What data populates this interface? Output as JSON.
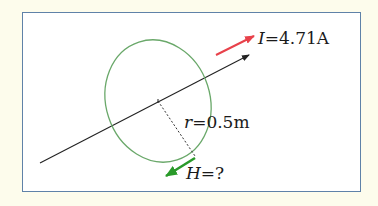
{
  "diagram": {
    "type": "magnetic-field-around-current-carrying-wire",
    "current": {
      "symbol": "I",
      "equals": "=",
      "value": "4.71A",
      "arrow_color": "#e8414a"
    },
    "radius": {
      "symbol": "r",
      "equals": "=",
      "value": "0.5m"
    },
    "field": {
      "symbol": "H",
      "equals": "=",
      "value": "?",
      "arrow_color": "#2a9a2a"
    },
    "colors": {
      "background": "#fdfcec",
      "frame_border": "#5f82a8",
      "wire": "#222222",
      "loop": "#6aa86a",
      "current_arrow": "#e8414a",
      "field_arrow": "#2a9a2a"
    }
  }
}
